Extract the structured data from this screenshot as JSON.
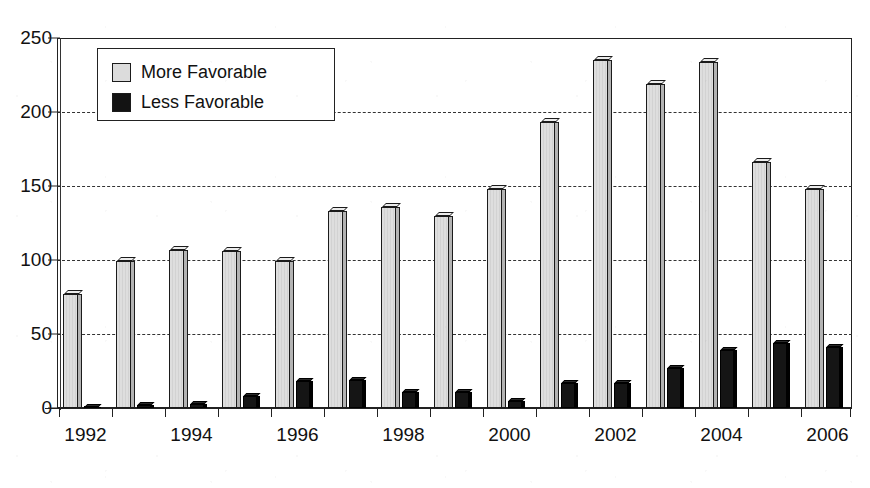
{
  "chart_data": {
    "type": "bar",
    "title": "",
    "subtitle": "",
    "xlabel": "",
    "ylabel": "",
    "ylim": [
      0,
      250
    ],
    "yticks": [
      0,
      50,
      100,
      150,
      200,
      250
    ],
    "grid": true,
    "legend_position": "top-left",
    "categories": [
      "1992",
      "1993",
      "1994",
      "1995",
      "1996",
      "1997",
      "1998",
      "1999",
      "2000",
      "2001",
      "2002",
      "2003",
      "2004",
      "2005",
      "2006"
    ],
    "xtick_labels": [
      "1992",
      "1994",
      "1996",
      "1998",
      "2000",
      "2002",
      "2004",
      "2006"
    ],
    "series": [
      {
        "name": "More Favorable",
        "color": "#dcdcdc",
        "values": [
          77,
          99,
          107,
          106,
          99,
          133,
          136,
          130,
          148,
          193,
          235,
          219,
          234,
          166,
          148
        ]
      },
      {
        "name": "Less Favorable",
        "color": "#131313",
        "values": [
          1,
          2,
          3,
          8,
          18,
          19,
          11,
          11,
          5,
          17,
          17,
          27,
          39,
          44,
          41
        ]
      }
    ]
  },
  "legend": {
    "items": [
      {
        "label": "More Favorable",
        "swatch": "more"
      },
      {
        "label": "Less Favorable",
        "swatch": "less"
      }
    ]
  },
  "axes": {
    "y_tick_labels": [
      "250",
      "200",
      "150",
      "100",
      "50",
      "0"
    ]
  }
}
